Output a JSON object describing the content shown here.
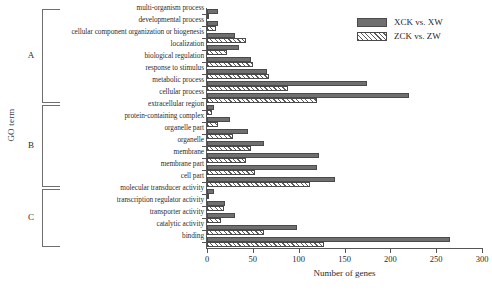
{
  "axes": {
    "ylabel": "GO term",
    "xlabel": "Number of genes",
    "xticks": [
      "0",
      "50",
      "100",
      "150",
      "200",
      "250",
      "300"
    ]
  },
  "legend": {
    "items": [
      {
        "label": "XCK vs. XW",
        "style": "solid",
        "color": "#6f6f6f"
      },
      {
        "label": "ZCK vs. ZW",
        "style": "hatch",
        "color": "#5d5d5d"
      }
    ]
  },
  "groups": [
    {
      "letter": "A"
    },
    {
      "letter": "B"
    },
    {
      "letter": "C"
    }
  ],
  "caption": "",
  "chart_data": {
    "type": "bar",
    "orientation": "horizontal",
    "title": "",
    "xlabel": "Number of genes",
    "ylabel": "GO term",
    "xlim": [
      0,
      300
    ],
    "grid": false,
    "legend_position": "top-right",
    "categories": [
      "multi-organism process",
      "developmental process",
      "cellular component organization or biogenesis",
      "localization",
      "biological regulation",
      "response to stimulus",
      "metabolic process",
      "cellular process",
      "extracellular region",
      "protein-containing complex",
      "organelle part",
      "organelle",
      "membrane",
      "membrane part",
      "cell part",
      "molecular transducer activity",
      "transcription regulator activity",
      "transporter activity",
      "catalytic activity",
      "binding"
    ],
    "group_assignment": [
      "A",
      "A",
      "A",
      "A",
      "A",
      "A",
      "A",
      "A",
      "B",
      "B",
      "B",
      "B",
      "B",
      "B",
      "B",
      "C",
      "C",
      "C",
      "C",
      "C"
    ],
    "series": [
      {
        "name": "XCK vs. XW",
        "values": [
          12,
          12,
          30,
          35,
          48,
          65,
          175,
          220,
          8,
          25,
          45,
          62,
          122,
          120,
          140,
          8,
          20,
          30,
          98,
          265
        ]
      },
      {
        "name": "ZCK vs. ZW",
        "values": [
          2,
          10,
          42,
          22,
          50,
          68,
          88,
          120,
          5,
          12,
          28,
          48,
          42,
          52,
          112,
          2,
          18,
          15,
          62,
          128
        ]
      }
    ]
  }
}
